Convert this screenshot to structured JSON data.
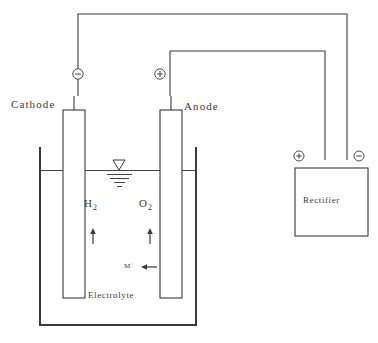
{
  "diagram": {
    "line_color": "#3a3a3a",
    "background_color": "#ffffff"
  },
  "labels": {
    "cathode": "Cathode",
    "anode": "Anode",
    "hydrogen": "H",
    "hydrogen_sub": "2",
    "oxygen": "O",
    "oxygen_sub": "2",
    "ion": "M",
    "ion_charge": "+",
    "electrolyte": "Electrolyte",
    "rectifier": "Rectifier"
  },
  "terminals": {
    "cathode_terminal": {
      "name": "negative-terminal",
      "symbol": "minus",
      "sign": "−"
    },
    "anode_terminal": {
      "name": "positive-terminal",
      "symbol": "plus",
      "sign": "+"
    },
    "rectifier_positive": {
      "name": "rectifier-positive-terminal",
      "symbol": "plus",
      "sign": "+"
    },
    "rectifier_negative": {
      "name": "rectifier-negative-terminal",
      "symbol": "minus",
      "sign": "−"
    }
  },
  "flows": {
    "hydrogen_arrow": "up",
    "oxygen_arrow": "up",
    "ion_arrow": "left"
  },
  "markers": {
    "water_level": "liquid-level-symbol"
  }
}
